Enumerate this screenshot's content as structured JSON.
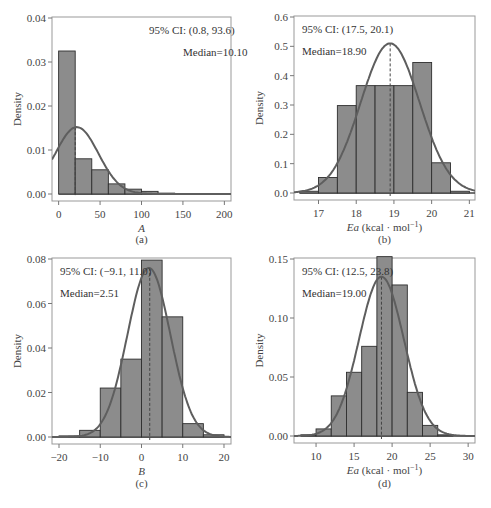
{
  "chart_data": [
    {
      "type": "bar",
      "panel": "(a)",
      "xlabel": "A",
      "ylabel": "Density",
      "annotation_ci": "95% CI:  (0.8, 93.6)",
      "annotation_median": "Median=10.10",
      "xlim": [
        -8,
        208
      ],
      "ylim": [
        0,
        0.04
      ],
      "xticks": [
        0,
        50,
        100,
        150,
        200
      ],
      "yticks": [
        "0.00",
        "0.01",
        "0.02",
        "0.03",
        "0.04"
      ],
      "bins": [
        [
          0,
          20
        ],
        [
          20,
          40
        ],
        [
          40,
          60
        ],
        [
          60,
          80
        ],
        [
          80,
          100
        ],
        [
          100,
          120
        ],
        [
          120,
          140
        ],
        [
          140,
          200
        ]
      ],
      "values": [
        0.0325,
        0.008,
        0.0055,
        0.0023,
        0.0011,
        0.0006,
        0.0002,
        0.0001
      ],
      "median": 20,
      "fit": {
        "mean": 22,
        "sd": 26,
        "peak": 0.0152
      }
    },
    {
      "type": "bar",
      "panel": "(b)",
      "xlabel": "Ea (kcal · mol⁻¹)",
      "ylabel": "Density",
      "annotation_ci": "95% CI:  (17.5, 20.1)",
      "annotation_median": "Median=18.90",
      "xlim": [
        16.35,
        21.15
      ],
      "ylim": [
        0,
        0.6
      ],
      "xticks": [
        17,
        18,
        19,
        20,
        21
      ],
      "yticks": [
        "0.0",
        "0.1",
        "0.2",
        "0.3",
        "0.4",
        "0.5",
        "0.6"
      ],
      "bins": [
        [
          16.5,
          17
        ],
        [
          17,
          17.5
        ],
        [
          17.5,
          18
        ],
        [
          18,
          18.5
        ],
        [
          18.5,
          19
        ],
        [
          19,
          19.5
        ],
        [
          19.5,
          20
        ],
        [
          20,
          20.5
        ],
        [
          20.5,
          21
        ]
      ],
      "values": [
        0.006,
        0.053,
        0.298,
        0.366,
        0.366,
        0.366,
        0.445,
        0.103,
        0.006
      ],
      "median": 18.9,
      "fit": {
        "mean": 18.9,
        "sd": 0.78,
        "peak": 0.51
      }
    },
    {
      "type": "bar",
      "panel": "(c)",
      "xlabel": "B",
      "ylabel": "Density",
      "annotation_ci": "95% CI:  (−9.1, 11.0)",
      "annotation_median": "Median=2.51",
      "xlim": [
        -21.7,
        21.7
      ],
      "ylim": [
        0,
        0.08
      ],
      "xticks": [
        -20,
        -10,
        0,
        10,
        20
      ],
      "yticks": [
        "0.00",
        "0.02",
        "0.04",
        "0.06",
        "0.08"
      ],
      "bins": [
        [
          -20,
          -15
        ],
        [
          -15,
          -10
        ],
        [
          -10,
          -5
        ],
        [
          -5,
          0
        ],
        [
          0,
          5
        ],
        [
          5,
          10
        ],
        [
          10,
          15
        ],
        [
          15,
          20
        ]
      ],
      "values": [
        0.0005,
        0.003,
        0.022,
        0.035,
        0.0795,
        0.054,
        0.006,
        0.001
      ],
      "median": 2.0,
      "fit": {
        "mean": 1.8,
        "sd": 5.2,
        "peak": 0.076
      }
    },
    {
      "type": "bar",
      "panel": "(d)",
      "xlabel": "Ea (kcal · mol⁻¹)",
      "ylabel": "Density",
      "annotation_ci": "95% CI:  (12.5, 23.8)",
      "annotation_median": "Median=19.00",
      "xlim": [
        7.1,
        30.9
      ],
      "ylim": [
        0,
        0.15
      ],
      "xticks": [
        10,
        15,
        20,
        25,
        30
      ],
      "yticks": [
        "0.00",
        "0.05",
        "0.10",
        "0.15"
      ],
      "bins": [
        [
          8,
          10
        ],
        [
          10,
          12
        ],
        [
          12,
          14
        ],
        [
          14,
          16
        ],
        [
          16,
          18
        ],
        [
          18,
          20
        ],
        [
          20,
          22
        ],
        [
          22,
          24
        ],
        [
          24,
          26
        ],
        [
          26,
          28
        ]
      ],
      "values": [
        0.001,
        0.006,
        0.034,
        0.054,
        0.076,
        0.152,
        0.128,
        0.037,
        0.009,
        0.001
      ],
      "median": 18.6,
      "fit": {
        "mean": 18.6,
        "sd": 2.95,
        "peak": 0.135
      }
    }
  ],
  "colors": {
    "bar_fill": "#8c8c8c",
    "bar_edge": "#2e2e2e",
    "curve": "#5e5e5e",
    "median_line": "#444444",
    "axis": "#999999"
  },
  "panels_layout": [
    {
      "box": [
        52,
        17,
        231,
        201
      ],
      "label_y": 243
    },
    {
      "box": [
        294,
        16,
        475,
        200
      ],
      "label_y": 243
    },
    {
      "box": [
        52,
        258,
        231,
        444
      ],
      "label_y": 487
    },
    {
      "box": [
        294,
        258,
        475,
        443
      ],
      "label_y": 487
    }
  ]
}
